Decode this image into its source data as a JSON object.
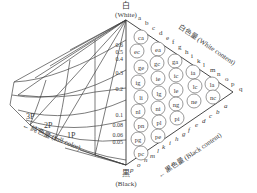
{
  "diagram": {
    "top_label": {
      "kanji": "白",
      "english": "(White)"
    },
    "bottom_label": {
      "kanji": "黒",
      "english": "(Black)"
    },
    "white_axis": {
      "label": "白色量 (White content)",
      "letters": [
        "a",
        "b",
        "c",
        "d",
        "e",
        "f",
        "g",
        "h",
        "i",
        "k",
        "l",
        "m",
        "n",
        "o",
        "p",
        "q"
      ]
    },
    "black_axis": {
      "label": "黒色量 (Black content)",
      "letters": [
        "a",
        "b",
        "c",
        "d",
        "e",
        "f",
        "g",
        "h",
        "i",
        "k",
        "l",
        "m",
        "n",
        "o",
        "p"
      ]
    },
    "full_color_axis": {
      "label": "純色量 (full color)"
    },
    "scale_ticks": [
      "0.6",
      "0.5",
      "0.4",
      "0.3",
      "0.2",
      "0.1",
      "0.08",
      "0.06",
      "0.05"
    ],
    "hue_sections": [
      "3P",
      "2P",
      "1P"
    ],
    "circle_codes": [
      "ca",
      "ea",
      "ec",
      "ga",
      "gc",
      "ge",
      "ia",
      "ic",
      "ie",
      "ig",
      "la",
      "lc",
      "le",
      "lg",
      "li",
      "na",
      "nc",
      "ne",
      "ng",
      "ni",
      "nl",
      "pa",
      "pc",
      "pe",
      "pg",
      "pi",
      "pl",
      "pn"
    ]
  }
}
